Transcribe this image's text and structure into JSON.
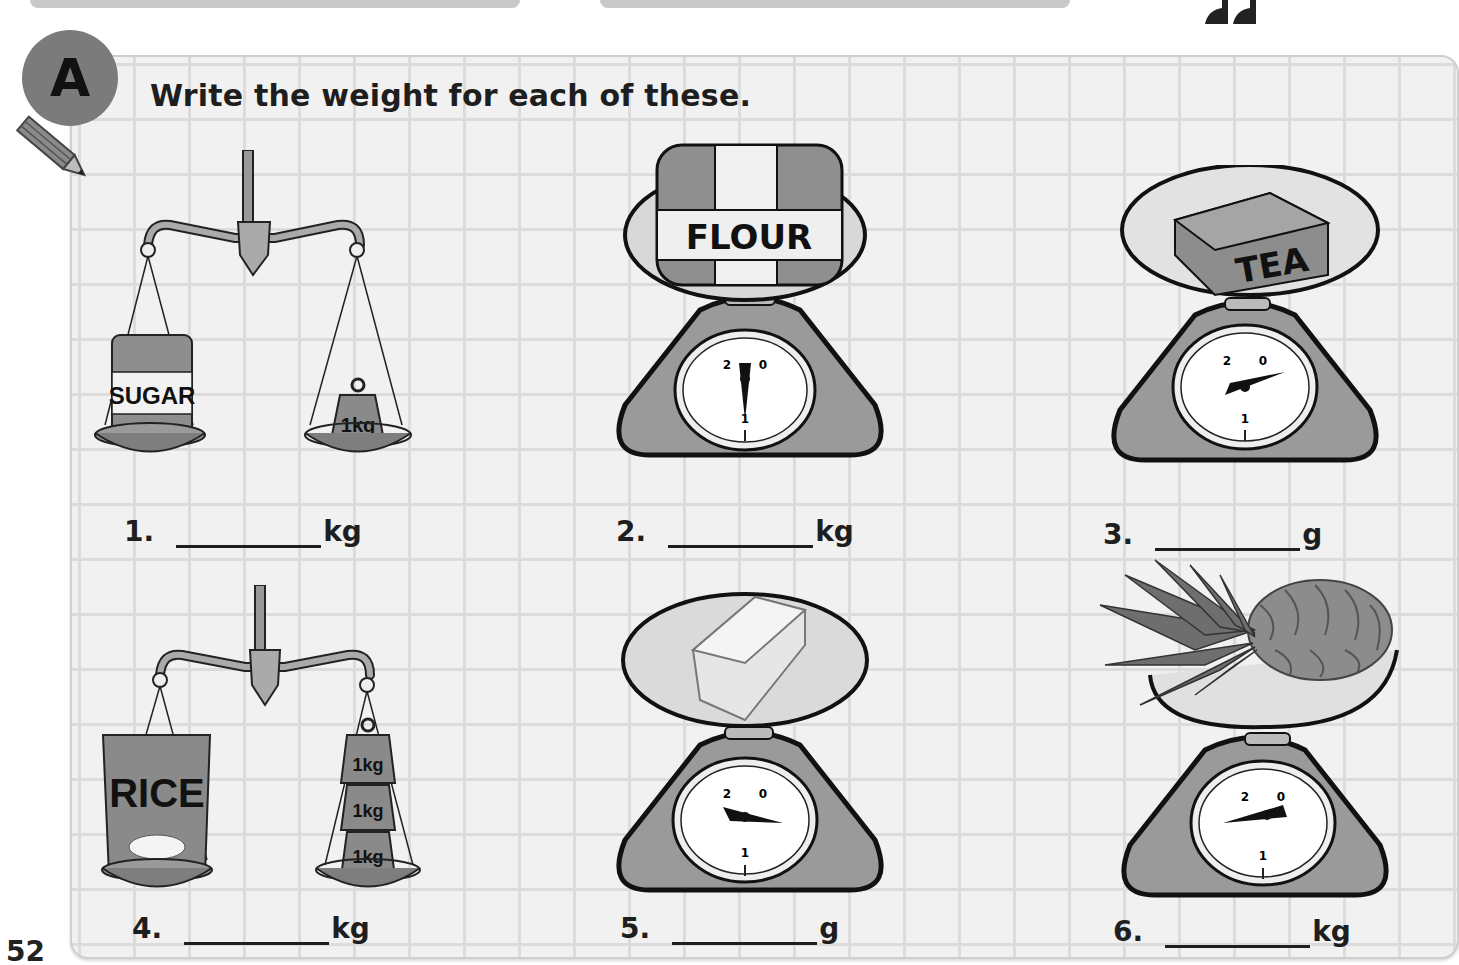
{
  "page": {
    "page_number": "52",
    "section_badge": "A",
    "instruction": "Write the weight for each of these."
  },
  "questions": [
    {
      "number": "1.",
      "unit": "kg",
      "item_label": "SUGAR",
      "type": "balance",
      "weights": [
        "1kg"
      ]
    },
    {
      "number": "2.",
      "unit": "kg",
      "item_label": "FLOUR",
      "type": "dial-scale",
      "dial_labels": [
        "2",
        "0",
        "1"
      ]
    },
    {
      "number": "3.",
      "unit": "g",
      "item_label": "TEA",
      "type": "dial-scale",
      "dial_labels": [
        "2",
        "0",
        "1"
      ]
    },
    {
      "number": "4.",
      "unit": "kg",
      "item_label": "RICE",
      "type": "balance",
      "weights": [
        "1kg",
        "1kg",
        "1kg"
      ]
    },
    {
      "number": "5.",
      "unit": "g",
      "item_label": "",
      "type": "dial-scale",
      "dial_labels": [
        "2",
        "0",
        "1"
      ]
    },
    {
      "number": "6.",
      "unit": "kg",
      "item_label": "",
      "type": "dial-scale",
      "dial_labels": [
        "2",
        "0",
        "1"
      ]
    }
  ],
  "colors": {
    "badge": "#7b7b7b",
    "scale_body": "#9a9a9a",
    "ink": "#1e1e1e"
  }
}
